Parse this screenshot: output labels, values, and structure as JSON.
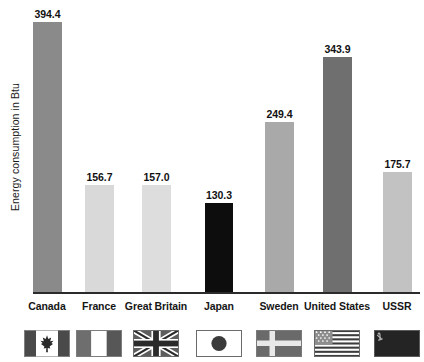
{
  "chart_data": {
    "type": "bar",
    "title": "",
    "subtitle": "",
    "xlabel": "",
    "ylabel": "Energy consumption in Btu",
    "ylim": [
      0,
      394.4
    ],
    "grid": false,
    "legend": "none",
    "categories": [
      "Canada",
      "France",
      "Great Britain",
      "Japan",
      "Sweden",
      "United States",
      "USSR"
    ],
    "values": [
      394.4,
      156.7,
      157.0,
      130.3,
      249.4,
      343.9,
      175.7
    ],
    "value_labels": [
      "394.4",
      "156.7",
      "157.0",
      "130.3",
      "249.4",
      "343.9",
      "175.7"
    ],
    "bar_colors": [
      "#8a8a8a",
      "#d9d9d9",
      "#dddddd",
      "#0d0d0d",
      "#a9a9a9",
      "#6f6f6f",
      "#c2c2c2"
    ]
  },
  "axis": {
    "y_title": "Energy consumption in Btu",
    "baseline_color": "#2b2b2b"
  },
  "bars": [
    {
      "category": "Canada",
      "value": 394.4,
      "label": "394.4",
      "color": "#8a8a8a",
      "flag": "flag-canada"
    },
    {
      "category": "France",
      "value": 156.7,
      "label": "156.7",
      "color": "#d9d9d9",
      "flag": "flag-france"
    },
    {
      "category": "Great Britain",
      "value": 157.0,
      "label": "157.0",
      "color": "#dddddd",
      "flag": "flag-great-britain"
    },
    {
      "category": "Japan",
      "value": 130.3,
      "label": "130.3",
      "color": "#0d0d0d",
      "flag": "flag-japan"
    },
    {
      "category": "Sweden",
      "value": 249.4,
      "label": "249.4",
      "color": "#a9a9a9",
      "flag": "flag-sweden"
    },
    {
      "category": "United States",
      "value": 343.9,
      "label": "343.9",
      "color": "#6f6f6f",
      "flag": "flag-united-states"
    },
    {
      "category": "USSR",
      "value": 175.7,
      "label": "175.7",
      "color": "#c2c2c2",
      "flag": "flag-ussr"
    }
  ]
}
